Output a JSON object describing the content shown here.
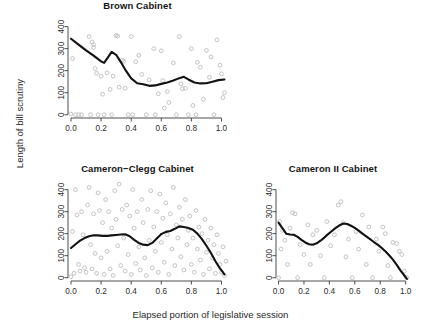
{
  "figure": {
    "xlabel": "Elapsed portion of legislative session",
    "ylabel": "Length of bill scrutiny"
  },
  "chart_data": [
    {
      "type": "scatter",
      "title": "Brown Cabinet",
      "xlabel": "",
      "ylabel": "Length of bill scrutiny",
      "xlim": [
        -0.02,
        1.05
      ],
      "ylim": [
        -15,
        430
      ],
      "xticks": [
        0.0,
        0.2,
        0.4,
        0.6,
        0.8,
        1.0
      ],
      "xticklabels": [
        "0.0",
        "0.2",
        "0.4",
        "0.6",
        "0.8",
        "1.0"
      ],
      "yticks": [
        0,
        100,
        200,
        300,
        400
      ],
      "yticklabels": [
        "0",
        "100",
        "200",
        "300",
        "400"
      ],
      "grid": false,
      "legend": false,
      "point_style": "open-circle",
      "point_color": "#b9b9b9",
      "line_color": "#121212",
      "points": [
        [
          0.0,
          3
        ],
        [
          0.01,
          255
        ],
        [
          0.03,
          0
        ],
        [
          0.05,
          0
        ],
        [
          0.07,
          0
        ],
        [
          0.12,
          355
        ],
        [
          0.13,
          0
        ],
        [
          0.14,
          330
        ],
        [
          0.15,
          305
        ],
        [
          0.15,
          318
        ],
        [
          0.16,
          210
        ],
        [
          0.17,
          188
        ],
        [
          0.18,
          0
        ],
        [
          0.2,
          175
        ],
        [
          0.21,
          93
        ],
        [
          0.22,
          0
        ],
        [
          0.24,
          190
        ],
        [
          0.26,
          115
        ],
        [
          0.27,
          0
        ],
        [
          0.28,
          175
        ],
        [
          0.3,
          360
        ],
        [
          0.31,
          357
        ],
        [
          0.32,
          125
        ],
        [
          0.34,
          247
        ],
        [
          0.35,
          242
        ],
        [
          0.36,
          120
        ],
        [
          0.38,
          0
        ],
        [
          0.4,
          355
        ],
        [
          0.41,
          0
        ],
        [
          0.43,
          240
        ],
        [
          0.45,
          270
        ],
        [
          0.47,
          183
        ],
        [
          0.5,
          0
        ],
        [
          0.52,
          158
        ],
        [
          0.55,
          300
        ],
        [
          0.56,
          0
        ],
        [
          0.58,
          95
        ],
        [
          0.6,
          290
        ],
        [
          0.61,
          155
        ],
        [
          0.62,
          30
        ],
        [
          0.64,
          105
        ],
        [
          0.65,
          55
        ],
        [
          0.68,
          235
        ],
        [
          0.7,
          0
        ],
        [
          0.72,
          355
        ],
        [
          0.73,
          140
        ],
        [
          0.74,
          118
        ],
        [
          0.76,
          120
        ],
        [
          0.78,
          0
        ],
        [
          0.8,
          300
        ],
        [
          0.81,
          42
        ],
        [
          0.83,
          0
        ],
        [
          0.84,
          238
        ],
        [
          0.86,
          215
        ],
        [
          0.88,
          70
        ],
        [
          0.9,
          292
        ],
        [
          0.92,
          170
        ],
        [
          0.93,
          262
        ],
        [
          0.95,
          0
        ],
        [
          0.97,
          340
        ],
        [
          0.99,
          225
        ],
        [
          1.0,
          185
        ],
        [
          1.01,
          78
        ],
        [
          1.02,
          100
        ]
      ],
      "smooth_line": [
        [
          0.0,
          345
        ],
        [
          0.05,
          318
        ],
        [
          0.1,
          292
        ],
        [
          0.15,
          268
        ],
        [
          0.2,
          242
        ],
        [
          0.22,
          235
        ],
        [
          0.25,
          265
        ],
        [
          0.27,
          285
        ],
        [
          0.3,
          272
        ],
        [
          0.33,
          240
        ],
        [
          0.36,
          205
        ],
        [
          0.4,
          165
        ],
        [
          0.44,
          143
        ],
        [
          0.48,
          138
        ],
        [
          0.52,
          131
        ],
        [
          0.56,
          133
        ],
        [
          0.6,
          140
        ],
        [
          0.64,
          146
        ],
        [
          0.68,
          155
        ],
        [
          0.72,
          166
        ],
        [
          0.75,
          172
        ],
        [
          0.78,
          160
        ],
        [
          0.82,
          146
        ],
        [
          0.86,
          142
        ],
        [
          0.9,
          143
        ],
        [
          0.94,
          150
        ],
        [
          0.98,
          157
        ],
        [
          1.02,
          160
        ]
      ]
    },
    {
      "type": "scatter",
      "title": "Cameron−Clegg Cabinet",
      "xlabel": "Elapsed portion of legislative session",
      "ylabel": "Length of bill scrutiny",
      "xlim": [
        -0.02,
        1.05
      ],
      "ylim": [
        -15,
        430
      ],
      "xticks": [
        0.0,
        0.2,
        0.4,
        0.6,
        0.8,
        1.0
      ],
      "xticklabels": [
        "0.0",
        "0.2",
        "0.4",
        "0.6",
        "0.8",
        "1.0"
      ],
      "yticks": [
        0,
        100,
        200,
        300,
        400
      ],
      "yticklabels": [
        "0",
        "100",
        "200",
        "300",
        "400"
      ],
      "grid": false,
      "legend": false,
      "point_style": "open-circle",
      "point_color": "#b9b9b9",
      "line_color": "#121212",
      "points": [
        [
          0.0,
          5
        ],
        [
          0.01,
          210
        ],
        [
          0.02,
          20
        ],
        [
          0.03,
          400
        ],
        [
          0.04,
          285
        ],
        [
          0.05,
          60
        ],
        [
          0.06,
          30
        ],
        [
          0.07,
          300
        ],
        [
          0.08,
          195
        ],
        [
          0.09,
          45
        ],
        [
          0.1,
          25
        ],
        [
          0.11,
          330
        ],
        [
          0.12,
          410
        ],
        [
          0.13,
          150
        ],
        [
          0.14,
          40
        ],
        [
          0.15,
          290
        ],
        [
          0.16,
          110
        ],
        [
          0.17,
          20
        ],
        [
          0.18,
          385
        ],
        [
          0.19,
          305
        ],
        [
          0.2,
          90
        ],
        [
          0.21,
          250
        ],
        [
          0.22,
          15
        ],
        [
          0.23,
          355
        ],
        [
          0.24,
          120
        ],
        [
          0.25,
          300
        ],
        [
          0.26,
          40
        ],
        [
          0.27,
          225
        ],
        [
          0.28,
          10
        ],
        [
          0.29,
          395
        ],
        [
          0.3,
          265
        ],
        [
          0.31,
          145
        ],
        [
          0.32,
          425
        ],
        [
          0.33,
          55
        ],
        [
          0.34,
          310
        ],
        [
          0.35,
          180
        ],
        [
          0.36,
          30
        ],
        [
          0.37,
          330
        ],
        [
          0.38,
          105
        ],
        [
          0.39,
          280
        ],
        [
          0.4,
          15
        ],
        [
          0.41,
          400
        ],
        [
          0.42,
          225
        ],
        [
          0.43,
          65
        ],
        [
          0.44,
          300
        ],
        [
          0.45,
          140
        ],
        [
          0.46,
          35
        ],
        [
          0.47,
          355
        ],
        [
          0.48,
          250
        ],
        [
          0.49,
          90
        ],
        [
          0.5,
          10
        ],
        [
          0.51,
          310
        ],
        [
          0.52,
          170
        ],
        [
          0.53,
          395
        ],
        [
          0.54,
          45
        ],
        [
          0.55,
          230
        ],
        [
          0.56,
          120
        ],
        [
          0.57,
          300
        ],
        [
          0.58,
          25
        ],
        [
          0.59,
          380
        ],
        [
          0.6,
          160
        ],
        [
          0.61,
          270
        ],
        [
          0.62,
          70
        ],
        [
          0.63,
          340
        ],
        [
          0.64,
          195
        ],
        [
          0.65,
          15
        ],
        [
          0.66,
          290
        ],
        [
          0.67,
          130
        ],
        [
          0.68,
          410
        ],
        [
          0.69,
          55
        ],
        [
          0.7,
          240
        ],
        [
          0.71,
          180
        ],
        [
          0.72,
          320
        ],
        [
          0.73,
          95
        ],
        [
          0.74,
          265
        ],
        [
          0.75,
          35
        ],
        [
          0.76,
          355
        ],
        [
          0.77,
          150
        ],
        [
          0.78,
          215
        ],
        [
          0.79,
          280
        ],
        [
          0.8,
          60
        ],
        [
          0.81,
          180
        ],
        [
          0.82,
          25
        ],
        [
          0.83,
          305
        ],
        [
          0.84,
          130
        ],
        [
          0.85,
          230
        ],
        [
          0.86,
          80
        ],
        [
          0.87,
          200
        ],
        [
          0.88,
          15
        ],
        [
          0.89,
          265
        ],
        [
          0.9,
          115
        ],
        [
          0.91,
          170
        ],
        [
          0.92,
          40
        ],
        [
          0.93,
          225
        ],
        [
          0.94,
          90
        ],
        [
          0.95,
          150
        ],
        [
          0.96,
          20
        ],
        [
          0.97,
          195
        ],
        [
          0.98,
          110
        ],
        [
          0.99,
          60
        ],
        [
          1.0,
          25
        ],
        [
          1.01,
          140
        ],
        [
          1.02,
          10
        ],
        [
          1.03,
          75
        ]
      ],
      "smooth_line": [
        [
          0.0,
          135
        ],
        [
          0.03,
          152
        ],
        [
          0.06,
          168
        ],
        [
          0.09,
          180
        ],
        [
          0.12,
          188
        ],
        [
          0.15,
          193
        ],
        [
          0.18,
          192
        ],
        [
          0.21,
          190
        ],
        [
          0.24,
          190
        ],
        [
          0.27,
          192
        ],
        [
          0.3,
          194
        ],
        [
          0.33,
          196
        ],
        [
          0.36,
          197
        ],
        [
          0.39,
          188
        ],
        [
          0.42,
          172
        ],
        [
          0.45,
          158
        ],
        [
          0.48,
          150
        ],
        [
          0.51,
          148
        ],
        [
          0.54,
          158
        ],
        [
          0.57,
          178
        ],
        [
          0.6,
          198
        ],
        [
          0.63,
          208
        ],
        [
          0.66,
          212
        ],
        [
          0.69,
          222
        ],
        [
          0.72,
          233
        ],
        [
          0.75,
          230
        ],
        [
          0.78,
          226
        ],
        [
          0.81,
          218
        ],
        [
          0.84,
          200
        ],
        [
          0.87,
          175
        ],
        [
          0.9,
          145
        ],
        [
          0.93,
          112
        ],
        [
          0.96,
          75
        ],
        [
          0.99,
          42
        ],
        [
          1.02,
          15
        ]
      ]
    },
    {
      "type": "scatter",
      "title": "Cameron II Cabinet",
      "xlabel": "Elapsed portion of legislative session",
      "ylabel": "",
      "xlim": [
        -0.02,
        1.05
      ],
      "ylim": [
        -15,
        430
      ],
      "xticks": [
        0.0,
        0.2,
        0.4,
        0.6,
        0.8,
        1.0
      ],
      "xticklabels": [
        "0.0",
        "0.2",
        "0.4",
        "0.6",
        "0.8",
        "1.0"
      ],
      "yticks": [
        0,
        100,
        200,
        300,
        400
      ],
      "yticklabels": [
        "0",
        "100",
        "200",
        "300",
        "400"
      ],
      "grid": false,
      "legend": false,
      "point_style": "open-circle",
      "point_color": "#b9b9b9",
      "line_color": "#121212",
      "points": [
        [
          0.0,
          0
        ],
        [
          0.01,
          255
        ],
        [
          0.02,
          130
        ],
        [
          0.03,
          215
        ],
        [
          0.05,
          170
        ],
        [
          0.07,
          60
        ],
        [
          0.09,
          225
        ],
        [
          0.11,
          295
        ],
        [
          0.13,
          290
        ],
        [
          0.15,
          0
        ],
        [
          0.17,
          150
        ],
        [
          0.2,
          105
        ],
        [
          0.23,
          240
        ],
        [
          0.25,
          60
        ],
        [
          0.27,
          195
        ],
        [
          0.3,
          215
        ],
        [
          0.33,
          100
        ],
        [
          0.36,
          0
        ],
        [
          0.38,
          255
        ],
        [
          0.41,
          145
        ],
        [
          0.44,
          195
        ],
        [
          0.47,
          330
        ],
        [
          0.49,
          345
        ],
        [
          0.51,
          250
        ],
        [
          0.53,
          95
        ],
        [
          0.55,
          175
        ],
        [
          0.58,
          0
        ],
        [
          0.61,
          210
        ],
        [
          0.63,
          130
        ],
        [
          0.66,
          285
        ],
        [
          0.69,
          60
        ],
        [
          0.71,
          230
        ],
        [
          0.74,
          0
        ],
        [
          0.77,
          175
        ],
        [
          0.79,
          120
        ],
        [
          0.82,
          230
        ],
        [
          0.84,
          200
        ],
        [
          0.86,
          55
        ],
        [
          0.88,
          0
        ],
        [
          0.9,
          160
        ],
        [
          0.93,
          155
        ],
        [
          0.95,
          120
        ],
        [
          0.97,
          105
        ],
        [
          0.99,
          30
        ],
        [
          1.01,
          0
        ]
      ],
      "smooth_line": [
        [
          0.0,
          250
        ],
        [
          0.03,
          225
        ],
        [
          0.06,
          200
        ],
        [
          0.09,
          196
        ],
        [
          0.12,
          195
        ],
        [
          0.15,
          185
        ],
        [
          0.18,
          172
        ],
        [
          0.21,
          160
        ],
        [
          0.24,
          152
        ],
        [
          0.27,
          150
        ],
        [
          0.3,
          156
        ],
        [
          0.33,
          168
        ],
        [
          0.36,
          182
        ],
        [
          0.39,
          198
        ],
        [
          0.42,
          212
        ],
        [
          0.45,
          226
        ],
        [
          0.48,
          238
        ],
        [
          0.51,
          246
        ],
        [
          0.54,
          244
        ],
        [
          0.57,
          236
        ],
        [
          0.6,
          226
        ],
        [
          0.63,
          214
        ],
        [
          0.66,
          200
        ],
        [
          0.69,
          188
        ],
        [
          0.72,
          175
        ],
        [
          0.75,
          162
        ],
        [
          0.78,
          150
        ],
        [
          0.81,
          136
        ],
        [
          0.84,
          120
        ],
        [
          0.87,
          102
        ],
        [
          0.9,
          82
        ],
        [
          0.93,
          58
        ],
        [
          0.96,
          32
        ],
        [
          0.99,
          10
        ],
        [
          1.01,
          -5
        ]
      ]
    }
  ]
}
